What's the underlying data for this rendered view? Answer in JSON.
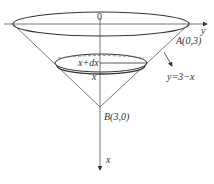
{
  "diagram": {
    "type": "cone-volume-slicing",
    "labels": {
      "origin": "0",
      "y_axis": "y",
      "x_axis": "x",
      "point_a": "A(0,3)",
      "point_b": "B(3,0)",
      "line": "y=3−x",
      "slice_top": "x+dx",
      "slice_bottom": "x"
    },
    "colors": {
      "stroke": "#333333",
      "dashed": "#777777",
      "background": "#ffffff"
    }
  }
}
